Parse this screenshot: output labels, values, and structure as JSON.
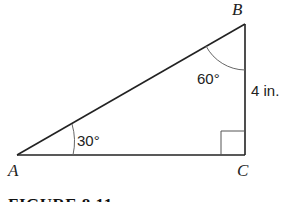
{
  "figure": {
    "vertices": {
      "A": "A",
      "B": "B",
      "C": "C"
    },
    "angles": {
      "A": "30°",
      "B": "60°",
      "C_right_angle": true
    },
    "side_BC": "4 in.",
    "caption": "FIGURE 8.11"
  }
}
